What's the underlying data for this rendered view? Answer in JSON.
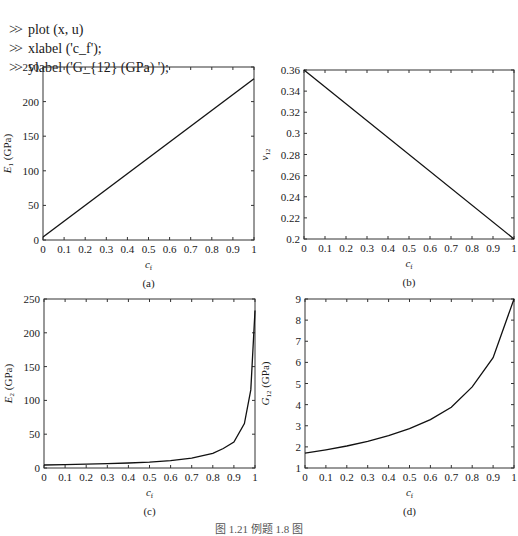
{
  "commands": [
    {
      "prompt": ">>",
      "text": "plot (x, u)"
    },
    {
      "prompt": ">>",
      "text": "xlabel ('c_f');"
    },
    {
      "prompt": ">>",
      "text": "ylabel ('G_{12} (GPa) ');"
    }
  ],
  "caption": "图 1.21  例题 1.8 图",
  "chart_data": [
    {
      "type": "line",
      "panel": "(a)",
      "xlabel": "c_f",
      "ylabel": "E_1 (GPa)",
      "xlim": [
        0,
        1
      ],
      "ylim": [
        0,
        250
      ],
      "xticks": [
        "0",
        "0.1",
        "0.2",
        "0.3",
        "0.4",
        "0.5",
        "0.6",
        "0.7",
        "0.8",
        "0.9",
        "1"
      ],
      "yticks": [
        "0",
        "50",
        "100",
        "150",
        "200",
        "250"
      ],
      "x": [
        0,
        1
      ],
      "values": [
        4.5,
        233
      ]
    },
    {
      "type": "line",
      "panel": "(b)",
      "xlabel": "c_f",
      "ylabel": "ν_12",
      "xlim": [
        0,
        1
      ],
      "ylim": [
        0.2,
        0.36
      ],
      "xticks": [
        "0",
        "0.1",
        "0.2",
        "0.3",
        "0.4",
        "0.5",
        "0.6",
        "0.7",
        "0.8",
        "0.9",
        "1"
      ],
      "yticks": [
        "0.2",
        "0.22",
        "0.24",
        "0.26",
        "0.28",
        "0.3",
        "0.32",
        "0.34",
        "0.36"
      ],
      "x": [
        0,
        1
      ],
      "values": [
        0.36,
        0.2
      ]
    },
    {
      "type": "line",
      "panel": "(c)",
      "xlabel": "c_f",
      "ylabel": "E_2 (GPa)",
      "xlim": [
        0,
        1
      ],
      "ylim": [
        0,
        250
      ],
      "xticks": [
        "0",
        "0.1",
        "0.2",
        "0.3",
        "0.4",
        "0.5",
        "0.6",
        "0.7",
        "0.8",
        "0.9",
        "1"
      ],
      "yticks": [
        "0",
        "50",
        "100",
        "150",
        "200",
        "250"
      ],
      "x": [
        0,
        0.1,
        0.2,
        0.3,
        0.4,
        0.5,
        0.6,
        0.7,
        0.8,
        0.85,
        0.9,
        0.95,
        0.98,
        1
      ],
      "values": [
        4.5,
        5.0,
        5.6,
        6.4,
        7.4,
        8.8,
        11.0,
        14.6,
        21.8,
        28.9,
        38.3,
        65.8,
        115.6,
        233
      ]
    },
    {
      "type": "line",
      "panel": "(d)",
      "xlabel": "c_f",
      "ylabel": "G_12 (GPa)",
      "xlim": [
        0,
        1
      ],
      "ylim": [
        1,
        9
      ],
      "xticks": [
        "0",
        "0.1",
        "0.2",
        "0.3",
        "0.4",
        "0.5",
        "0.6",
        "0.7",
        "0.8",
        "0.9",
        "1"
      ],
      "yticks": [
        "1",
        "2",
        "3",
        "4",
        "5",
        "6",
        "7",
        "8",
        "9"
      ],
      "x": [
        0,
        0.1,
        0.2,
        0.3,
        0.4,
        0.5,
        0.6,
        0.7,
        0.8,
        0.9,
        1
      ],
      "values": [
        1.7,
        1.86,
        2.04,
        2.26,
        2.53,
        2.86,
        3.29,
        3.88,
        4.84,
        6.22,
        9.0
      ]
    }
  ]
}
